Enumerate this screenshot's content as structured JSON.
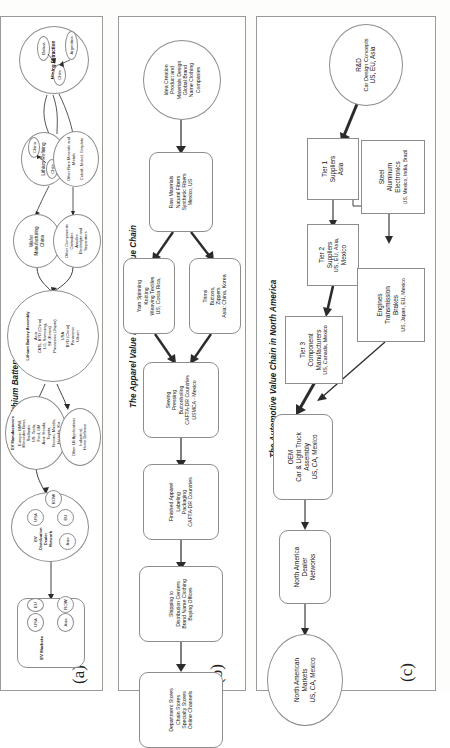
{
  "figure": {
    "panels": [
      {
        "label": "(a)",
        "title": "The Lithium Battery GVC",
        "nodes": {
          "mining": {
            "name": "Mining Extraction",
            "countries": [
              "Chile",
              "Argentina",
              "Bolivia"
            ]
          },
          "lithium_refining": {
            "name": "Lithium Refining",
            "flow": [
              "Chile",
              "China"
            ]
          },
          "other_minerals": {
            "name": "Other Rare Minerals and Metals",
            "items": [
              "Cobalt, Nickel, Graphite"
            ]
          },
          "wafer": {
            "name": "Wafer Manufacturing",
            "location": "China"
          },
          "other_components": {
            "name": "Other Components",
            "items": [
              "Cathodes",
              "Anodes",
              "Electrolyte and Separators"
            ]
          },
          "assembly": {
            "name": "Lithium Battery Assembly",
            "asia": "Asia\nCATL, BYD (China)\nLG, Samsung,\nSK (Korea)\nPanasonic (Japan)",
            "usa": "USA\nBYD (China)\nPanasonic\nUltium"
          },
          "ev_manufacturers": {
            "name": "EV Manufacturers",
            "europe": "Europe: BMW,\nMercedes Benz,\nStellantis",
            "us": "US: Tesla,\nFord, GM",
            "asia": "Asia: Honda,\nToyota,\nNissan, Mazda,\nHyundai, Kia"
          },
          "other_applications": {
            "name": "Other LB Applications",
            "items": [
              "Industrial,",
              "Home Defense"
            ]
          },
          "distribution": {
            "name": "EV Distribution Dealer Network",
            "regions": [
              "USA",
              "EU",
              "Asia",
              "ROW"
            ]
          },
          "markets": {
            "name": "EV Markets",
            "regions": [
              "USA",
              "EU",
              "Asia",
              "ROW"
            ]
          }
        }
      },
      {
        "label": "(b)",
        "title": "The Apparel Value North American Value Chain",
        "nodes": {
          "idea": {
            "lines": [
              "Idea Creation",
              "Product and",
              "Materials Design",
              "Global Brand",
              "Name Clothing",
              "Companies"
            ]
          },
          "raw": {
            "lines": [
              "Raw Materials",
              "Natural Fibers",
              "Synthetic Fibers",
              "Mexico, US"
            ]
          },
          "yarn": {
            "lines": [
              "Yarn Spinning",
              "Knitting",
              "Weaving Textiles",
              "US, Costa Rica,"
            ]
          },
          "trims": {
            "lines": [
              "Trims",
              "Buttons,",
              "Zippers",
              "Asia: China, Korea"
            ]
          },
          "sewing": {
            "lines": [
              "Sewing",
              "Pressing",
              "Buttonholing",
              "CAFTA-DR Countries",
              "USMCA - Mexico"
            ]
          },
          "finished": {
            "lines": [
              "Finished Apparel",
              "Labeling",
              "Packaging",
              "CAFTA-DR Countries"
            ]
          },
          "shipping": {
            "lines": [
              "Shipping to",
              "Distribution Centers",
              "Brand Name Clothing",
              "Buying Offices"
            ]
          },
          "retail": {
            "lines": [
              "Department Stores",
              "Chain Stores",
              "Specialty Stores",
              "Online Channels"
            ]
          }
        }
      },
      {
        "label": "(c)",
        "title": "The Automotive Value Chain in North America",
        "nodes": {
          "rd": {
            "lines": [
              "R&D",
              "Car Design Concepts",
              "US, EU, Asia"
            ]
          },
          "tier1": {
            "lines": [
              "Tier 1",
              "Suppliers",
              "Asia"
            ]
          },
          "tier2": {
            "lines": [
              "Tier 2",
              "Suppliers",
              "US, EU, Asia,",
              "Mexico"
            ]
          },
          "tier3": {
            "lines": [
              "Tier 3",
              "Component",
              "Manufacturers",
              "US, Canada, Mexico"
            ]
          },
          "materials": {
            "lines": [
              "Steel",
              "Aluminum",
              "Electronics",
              "US, Mexico, India, Brazil"
            ]
          },
          "engines": {
            "lines": [
              "Engines",
              "Transmission",
              "Brakes",
              "US, Japan, EU, Mexico"
            ]
          },
          "oem": {
            "lines": [
              "OEM",
              "Car & Light Truck",
              "Assembly",
              "US, CA, Mexico"
            ]
          },
          "dealer": {
            "lines": [
              "North America",
              "Dealer",
              "Networks"
            ]
          },
          "markets": {
            "lines": [
              "North American",
              "Markets",
              "US, CA, Mexico"
            ]
          }
        }
      }
    ]
  }
}
